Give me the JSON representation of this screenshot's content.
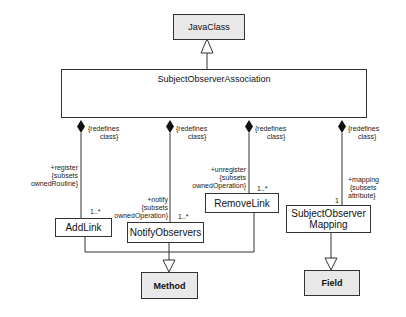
{
  "diagram": {
    "type": "UML class diagram",
    "classes": {
      "java_class": "JavaClass",
      "association": "SubjectObserverAssociation",
      "add_link": "AddLink",
      "notify_observers": "NotifyObservers",
      "remove_link": "RemoveLink",
      "mapping_line1": "SubjectObserver",
      "mapping_line2": "Mapping",
      "method": "Method",
      "field": "Field"
    },
    "ends": {
      "add_link": {
        "redefines_line1": "{redefines",
        "redefines_line2": "class}",
        "role_line1": "+register",
        "role_line2": "{subsets",
        "role_line3": "ownedRoutine}",
        "multiplicity": "1..*"
      },
      "notify": {
        "redefines_line1": "{redefines",
        "redefines_line2": "class}",
        "role_line1": "+notify",
        "role_line2": "{subsets",
        "role_line3": "ownedOperation}",
        "multiplicity": "1..*"
      },
      "remove_link": {
        "redefines_line1": "{redefines",
        "redefines_line2": "class}",
        "role_line1": "+unregister",
        "role_line2": "{subsets",
        "role_line3": "ownedOperation}",
        "multiplicity": "1..*"
      },
      "mapping": {
        "redefines_line1": "{redefines",
        "redefines_line2": "class}",
        "role_line1": "+mapping",
        "role_line2": "{subsets",
        "role_line3": "attribute}",
        "multiplicity": "1"
      }
    },
    "colors": {
      "line": "#333333",
      "gray_fill": "#e8e8e8"
    }
  }
}
